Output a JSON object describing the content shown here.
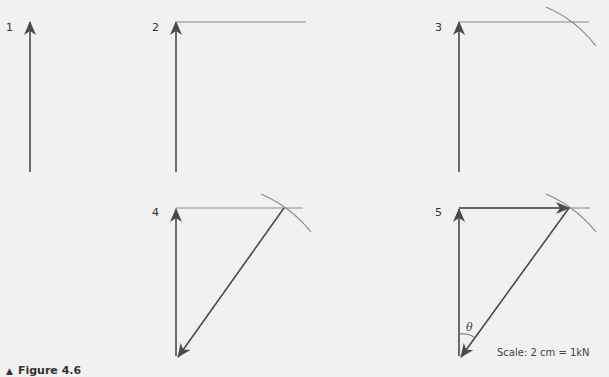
{
  "figure": {
    "caption_marker": "▲",
    "caption": "Figure 4.6",
    "panels": [
      {
        "label": "1",
        "step": "Draw vertical vector to scale"
      },
      {
        "label": "2",
        "step": "Draw horizontal construction line from tip"
      },
      {
        "label": "3",
        "step": "Swing arc of resultant length to cut the line"
      },
      {
        "label": "4",
        "step": "Draw resultant from intersection back to start"
      },
      {
        "label": "5",
        "step": "Complete horizontal vector and mark angle"
      }
    ],
    "angle_label": "θ",
    "scale_label": "Scale: 2 cm = 1kN"
  },
  "colors": {
    "background": "#f1f1f0",
    "vector": "#4a4a4a",
    "construction": "#8a8a8a",
    "text": "#333333"
  }
}
